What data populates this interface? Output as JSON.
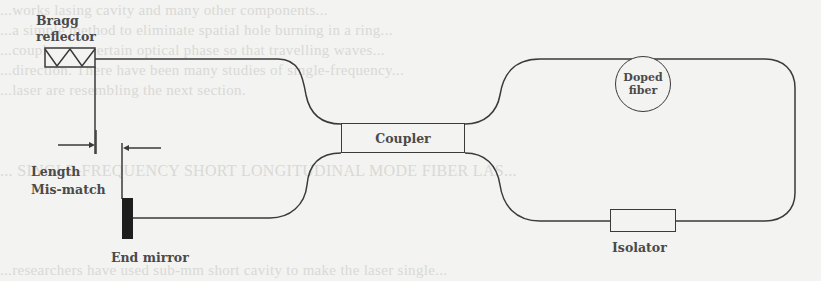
{
  "figure": {
    "type": "fiber laser schematic",
    "background_text_faded": [
      "...works lasing cavity and many other components...",
      "...a simple method to eliminate spatial hole burning in a ring...",
      "...coupler at a certain optical phase so that travelling waves...",
      "...direction. There have been many studies of single-frequency...",
      "...laser are resembling the next section.",
      "... SINGLE-FREQUENCY SHORT LONGITUDINAL MODE FIBER LAS...",
      "...researchers have used sub-mm short cavity to make the laser single..."
    ]
  },
  "components": {
    "bragg_reflector": {
      "label_line1": "Bragg",
      "label_line2": "reflector"
    },
    "length_mismatch": {
      "label_line1": "Length",
      "label_line2": "Mis-match"
    },
    "end_mirror": {
      "label": "End mirror"
    },
    "coupler": {
      "label": "Coupler"
    },
    "doped_fiber": {
      "label_line1": "Doped",
      "label_line2": "fiber"
    },
    "isolator": {
      "label": "Isolator",
      "arrow_direction": "left"
    }
  },
  "colors": {
    "line": "#3a3a3a",
    "label_text": "#4a4a4a",
    "mirror_fill": "#1e1e1e",
    "paper": "#f3f3f1"
  }
}
